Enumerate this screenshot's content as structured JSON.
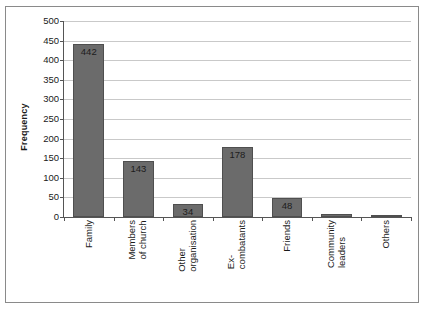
{
  "chart_data": {
    "type": "bar",
    "title": "",
    "xlabel": "",
    "ylabel": "Frequency",
    "ylim": [
      0,
      500
    ],
    "ytick_step": 50,
    "grid": true,
    "legend": null,
    "bar_color": "#6b6b6b",
    "categories": [
      "Family",
      "Members of church",
      "Other organisation",
      "Ex-combatants",
      "Friends",
      "Community leaders",
      "Others"
    ],
    "category_lines": [
      [
        "Family"
      ],
      [
        "Members",
        "of church"
      ],
      [
        "Other",
        "organisation"
      ],
      [
        "Ex-",
        "combatants"
      ],
      [
        "Friends"
      ],
      [
        "Community",
        "leaders"
      ],
      [
        "Others"
      ]
    ],
    "values": [
      442,
      143,
      34,
      178,
      48,
      7,
      4
    ],
    "data_labels": [
      "442",
      "143",
      "34",
      "178",
      "48",
      "",
      ""
    ],
    "ytick_labels": [
      "500",
      "450",
      "400",
      "350",
      "300",
      "250",
      "200",
      "150",
      "100",
      "50",
      "0"
    ],
    "ytick_values": [
      500,
      450,
      400,
      350,
      300,
      250,
      200,
      150,
      100,
      50,
      0
    ]
  }
}
